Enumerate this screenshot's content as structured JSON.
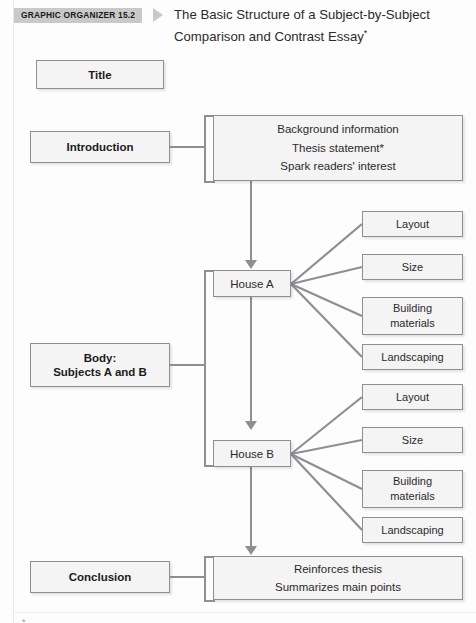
{
  "header": {
    "badge_label": "GRAPHIC ORGANIZER 15.2",
    "title_line1": "The Basic Structure of a Subject-by-Subject",
    "title_line2": "Comparison and Contrast Essay",
    "title_footnote_mark": "*"
  },
  "stages": {
    "title": "Title",
    "introduction": "Introduction",
    "body_line1": "Body:",
    "body_line2": "Subjects A and B",
    "conclusion": "Conclusion"
  },
  "introduction_content": {
    "line1": "Background information",
    "line2": "Thesis statement*",
    "line3": "Spark readers' interest"
  },
  "conclusion_content": {
    "line1": "Reinforces thesis",
    "line2": "Summarizes main points"
  },
  "subjects": [
    {
      "node_label": "House A",
      "details": [
        {
          "line1": "Layout",
          "line2": ""
        },
        {
          "line1": "Size",
          "line2": ""
        },
        {
          "line1": "Building",
          "line2": "materials"
        },
        {
          "line1": "Landscaping",
          "line2": ""
        }
      ]
    },
    {
      "node_label": "House B",
      "details": [
        {
          "line1": "Layout",
          "line2": ""
        },
        {
          "line1": "Size",
          "line2": ""
        },
        {
          "line1": "Building",
          "line2": "materials"
        },
        {
          "line1": "Landscaping",
          "line2": ""
        }
      ]
    }
  ],
  "colors": {
    "badge_background": "#c9c9c9",
    "box_fill": "#f4f4f4",
    "box_border": "#8d8f91",
    "connector": "#8d8f91",
    "text": "#2b2b2b",
    "page_background": "#fdfdfd"
  }
}
